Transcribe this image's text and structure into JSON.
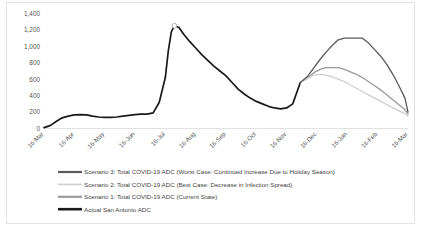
{
  "chart_data": {
    "type": "line",
    "title": "",
    "xlabel": "",
    "ylabel": "",
    "ylim": [
      0,
      1400
    ],
    "grid": false,
    "legend_position": "bottom-left",
    "categories": [
      "16-Mar",
      "16-Apr",
      "16-May",
      "16-Jun",
      "16-Jul",
      "16-Aug",
      "16-Sep",
      "16-Oct",
      "16-Nov",
      "16-Dec",
      "16-Jan",
      "16-Feb",
      "16-Mar"
    ],
    "yticks": [
      "0",
      "200",
      "400",
      "600",
      "800",
      "1,000",
      "1,200",
      "1,400"
    ],
    "ytick_values": [
      0,
      200,
      400,
      600,
      800,
      1000,
      1200,
      1400
    ],
    "x_start_month": "16-Mar",
    "colors": {
      "scenario3": "#595959",
      "scenario2": "#cfcfcf",
      "scenario1": "#9a9a9a",
      "actual": "#1a1a1a"
    },
    "series": [
      {
        "name": "Scenario 3: Total COVID-19 ADC (Worst Case: Continued Increase Due to Holiday Season)",
        "key": "scenario3",
        "color": "#595959",
        "x": [
          8.45,
          8.7,
          8.9,
          9.1,
          9.3,
          9.5,
          9.7,
          9.9,
          10.1,
          10.3,
          10.5,
          10.7,
          10.9,
          11.1,
          11.3,
          11.5,
          11.7,
          11.9,
          12.0
        ],
        "values": [
          560,
          640,
          740,
          840,
          930,
          1010,
          1080,
          1100,
          1100,
          1100,
          1100,
          1040,
          960,
          880,
          780,
          660,
          520,
          370,
          200
        ]
      },
      {
        "name": "Scenario 2: Total COVID-19 ADC (Best Case: Decrease in Infection Spread)",
        "key": "scenario2",
        "color": "#cfcfcf",
        "x": [
          8.45,
          8.7,
          8.9,
          9.1,
          9.3,
          9.5,
          9.7,
          9.9,
          10.1,
          10.3,
          10.5,
          10.7,
          10.9,
          11.1,
          11.3,
          11.5,
          11.7,
          11.9,
          12.0
        ],
        "values": [
          560,
          610,
          650,
          660,
          650,
          630,
          600,
          570,
          530,
          490,
          450,
          410,
          370,
          330,
          290,
          250,
          215,
          180,
          150
        ]
      },
      {
        "name": "Scenario 1: Total COVID-19 ADC (Current State)",
        "key": "scenario1",
        "color": "#9a9a9a",
        "x": [
          8.45,
          8.7,
          8.9,
          9.1,
          9.3,
          9.5,
          9.7,
          9.9,
          10.1,
          10.3,
          10.5,
          10.7,
          10.9,
          11.1,
          11.3,
          11.5,
          11.7,
          11.9,
          12.0
        ],
        "values": [
          560,
          620,
          680,
          720,
          740,
          740,
          740,
          720,
          690,
          660,
          620,
          570,
          520,
          470,
          410,
          350,
          290,
          230,
          175
        ]
      },
      {
        "name": "Actual San Antonio ADC",
        "key": "actual",
        "color": "#1a1a1a",
        "x": [
          0.0,
          0.2,
          0.4,
          0.6,
          0.8,
          1.0,
          1.2,
          1.4,
          1.6,
          1.8,
          2.0,
          2.2,
          2.4,
          2.6,
          2.8,
          3.0,
          3.2,
          3.4,
          3.6,
          3.8,
          4.0,
          4.1,
          4.2,
          4.3,
          4.45,
          4.6,
          4.8,
          5.0,
          5.2,
          5.4,
          5.6,
          5.8,
          6.0,
          6.2,
          6.4,
          6.6,
          6.8,
          7.0,
          7.2,
          7.4,
          7.6,
          7.8,
          8.0,
          8.2,
          8.45
        ],
        "values": [
          10,
          35,
          85,
          130,
          150,
          165,
          170,
          165,
          150,
          140,
          135,
          135,
          140,
          150,
          160,
          170,
          175,
          175,
          190,
          320,
          620,
          950,
          1180,
          1250,
          1230,
          1150,
          1060,
          980,
          900,
          830,
          760,
          700,
          640,
          560,
          480,
          420,
          370,
          330,
          300,
          270,
          250,
          240,
          250,
          300,
          560
        ]
      }
    ]
  },
  "legend": {
    "items": [
      {
        "label": "Scenario 3: Total COVID-19 ADC (Worst Case: Continued Increase Due to Holiday Season)",
        "color": "#595959",
        "weight": 2.2
      },
      {
        "label": "Scenario 2: Total COVID-19 ADC (Best Case: Decrease in Infection Spread)",
        "color": "#cfcfcf",
        "weight": 1.6
      },
      {
        "label": "Scenario 1: Total COVID-19 ADC (Current State)",
        "color": "#9a9a9a",
        "weight": 2.2
      },
      {
        "label": "Actual San Antonio ADC",
        "color": "#1a1a1a",
        "weight": 2.6
      }
    ]
  }
}
